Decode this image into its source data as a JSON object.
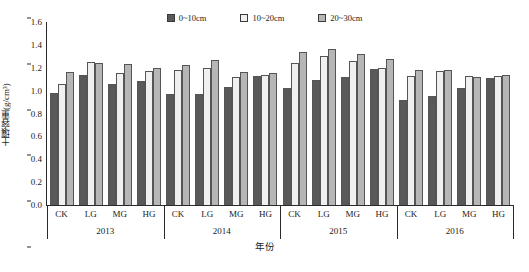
{
  "chart_data": {
    "type": "bar",
    "title": "",
    "xlabel": "年份",
    "ylabel": "土壤容重(g/cm³)",
    "ylim": [
      0.0,
      1.6
    ],
    "ytick_step": 0.2,
    "yticks": [
      "0.0",
      "0.2",
      "0.4",
      "0.6",
      "0.8",
      "1.0",
      "1.2",
      "1.4",
      "1.6"
    ],
    "grid": false,
    "legend_position": "top-center",
    "groups": [
      "2013",
      "2014",
      "2015",
      "2016"
    ],
    "categories": [
      "CK",
      "LG",
      "MG",
      "HG"
    ],
    "series": [
      {
        "name": "0~10cm",
        "color": "#595959",
        "values": [
          [
            0.98,
            1.14,
            1.06,
            1.08
          ],
          [
            0.97,
            0.97,
            1.03,
            1.13
          ],
          [
            1.02,
            1.09,
            1.12,
            1.19
          ],
          [
            0.92,
            0.95,
            1.02,
            1.11
          ]
        ]
      },
      {
        "name": "10~20cm",
        "color": "#f0f0ee",
        "values": [
          [
            1.06,
            1.25,
            1.15,
            1.17
          ],
          [
            1.18,
            1.2,
            1.12,
            1.14
          ],
          [
            1.24,
            1.3,
            1.26,
            1.2
          ],
          [
            1.13,
            1.17,
            1.13,
            1.13
          ]
        ]
      },
      {
        "name": "20~30cm",
        "color": "#b6b6b6",
        "values": [
          [
            1.16,
            1.24,
            1.23,
            1.2
          ],
          [
            1.22,
            1.27,
            1.16,
            1.15
          ],
          [
            1.34,
            1.36,
            1.32,
            1.28
          ],
          [
            1.18,
            1.18,
            1.12,
            1.14
          ]
        ]
      }
    ]
  },
  "legend": {
    "items": [
      {
        "label": "0~10cm",
        "swatch": "#595959"
      },
      {
        "label": "10~20cm",
        "swatch": "#f0f0ee"
      },
      {
        "label": "20~30cm",
        "swatch": "#b6b6b6"
      }
    ]
  },
  "axes": {
    "y_title": "土壤容重(g/cm³)",
    "x_title": "年份"
  }
}
